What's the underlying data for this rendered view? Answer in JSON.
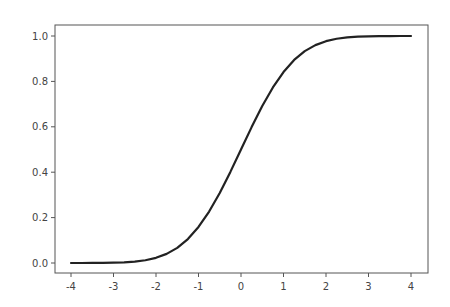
{
  "chart_data": {
    "type": "line",
    "title": "",
    "xlabel": "",
    "ylabel": "",
    "xlim": [
      -4.4,
      4.4
    ],
    "ylim": [
      -0.05,
      1.05
    ],
    "grid": false,
    "legend": null,
    "x_ticks": [
      -4,
      -3,
      -2,
      -1,
      0,
      1,
      2,
      3,
      4
    ],
    "x_tick_labels": [
      "-4",
      "-3",
      "-2",
      "-1",
      "0",
      "1",
      "2",
      "3",
      "4"
    ],
    "y_ticks": [
      0.0,
      0.2,
      0.4,
      0.6,
      0.8,
      1.0
    ],
    "y_tick_labels": [
      "0.0",
      "0.2",
      "0.4",
      "0.6",
      "0.8",
      "1.0"
    ],
    "series": [
      {
        "name": "sigmoid",
        "color": "#222222",
        "x": [
          -4,
          -3.75,
          -3.5,
          -3.25,
          -3,
          -2.75,
          -2.5,
          -2.25,
          -2,
          -1.75,
          -1.5,
          -1.25,
          -1,
          -0.75,
          -0.5,
          -0.25,
          0,
          0.25,
          0.5,
          0.75,
          1,
          1.25,
          1.5,
          1.75,
          2,
          2.25,
          2.5,
          2.75,
          3,
          3.25,
          3.5,
          3.75,
          4
        ],
        "values": [
          0.0,
          0.0001,
          0.0002,
          0.0006,
          0.0013,
          0.003,
          0.0062,
          0.0122,
          0.0228,
          0.0401,
          0.0668,
          0.1056,
          0.1587,
          0.2266,
          0.3085,
          0.4013,
          0.5,
          0.5987,
          0.6915,
          0.7734,
          0.8413,
          0.8944,
          0.9332,
          0.9599,
          0.9772,
          0.9878,
          0.9938,
          0.997,
          0.9987,
          0.9994,
          0.9998,
          0.9999,
          1.0
        ]
      }
    ]
  },
  "axes": {
    "x_ticks_text": [
      "-4",
      "-3",
      "-2",
      "-1",
      "0",
      "1",
      "2",
      "3",
      "4"
    ],
    "y_ticks_text": [
      "0.0",
      "0.2",
      "0.4",
      "0.6",
      "0.8",
      "1.0"
    ]
  }
}
